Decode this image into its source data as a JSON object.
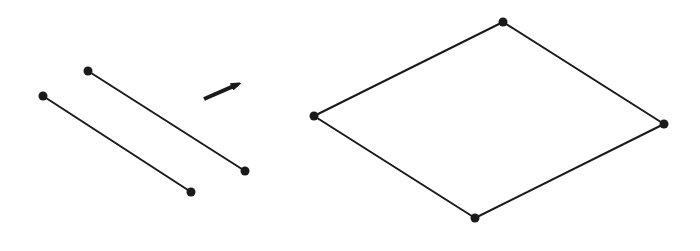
{
  "diagram": {
    "stroke_color": "#1a1a1a",
    "background": "#ffffff",
    "segments": [
      {
        "id": "segment-left",
        "from": [
          43,
          96
        ],
        "to": [
          191,
          192
        ]
      },
      {
        "id": "segment-right",
        "from": [
          88,
          71
        ],
        "to": [
          245,
          171
        ]
      }
    ],
    "arrow": {
      "from": [
        204,
        99
      ],
      "to": [
        243,
        82
      ]
    },
    "parallelogram": {
      "vertices": [
        [
          314,
          116
        ],
        [
          503,
          22
        ],
        [
          664,
          124
        ],
        [
          475,
          218
        ]
      ]
    }
  }
}
